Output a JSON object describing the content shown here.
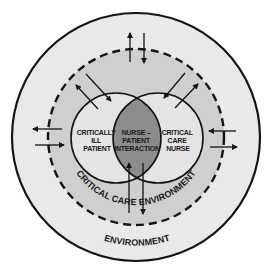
{
  "diagram": {
    "type": "nested-circle-model",
    "colors": {
      "background": "#ffffff",
      "environment_fill": "#e9e9e9",
      "critical_care_fill": "#cfcfcf",
      "inner_circle_fill": "#e4e4e4",
      "interaction_fill": "#8c8c8c",
      "stroke": "#141414"
    },
    "labels": {
      "outer_ring": "ENVIRONMENT",
      "middle_ring": "CRITICAL CARE ENVIRONMENT",
      "left_circle": [
        "CRITICALLY",
        "ILL",
        "PATIENT"
      ],
      "overlap": [
        "NURSE –",
        "PATIENT",
        "INTERACTION"
      ],
      "right_circle": [
        "CRITICAL",
        "CARE",
        "NURSE"
      ]
    },
    "arrows": [
      {
        "name": "top-up",
        "direction": "outward"
      },
      {
        "name": "top-down",
        "direction": "inward"
      },
      {
        "name": "left-out",
        "direction": "outward"
      },
      {
        "name": "left-in",
        "direction": "inward"
      },
      {
        "name": "right-in",
        "direction": "inward"
      },
      {
        "name": "right-out",
        "direction": "outward"
      },
      {
        "name": "bottom-up",
        "direction": "inward"
      },
      {
        "name": "bottom-down",
        "direction": "outward"
      },
      {
        "name": "upper-left-out",
        "direction": "outward"
      },
      {
        "name": "upper-left-in",
        "direction": "inward"
      },
      {
        "name": "upper-right-in",
        "direction": "inward"
      },
      {
        "name": "upper-right-out",
        "direction": "outward"
      }
    ]
  }
}
